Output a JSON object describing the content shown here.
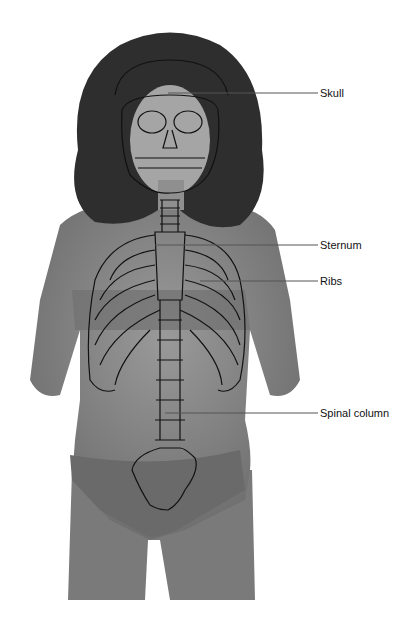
{
  "figure": {
    "colors": {
      "skin": "#8a8a8a",
      "hair": "#2e2e2e",
      "outline": "#111111",
      "leader": "#555555"
    }
  },
  "labels": [
    {
      "id": "skull",
      "text": "Skull",
      "x": 320,
      "y": 87,
      "line_from_x": 168,
      "line_y": 93
    },
    {
      "id": "sternum",
      "text": "Sternum",
      "x": 320,
      "y": 239,
      "line_from_x": 155,
      "line_y": 245
    },
    {
      "id": "ribs",
      "text": "Ribs",
      "x": 320,
      "y": 275,
      "line_from_x": 200,
      "line_y": 281
    },
    {
      "id": "spinal-column",
      "text": "Spinal column",
      "x": 320,
      "y": 407,
      "line_from_x": 165,
      "line_y": 413
    }
  ]
}
